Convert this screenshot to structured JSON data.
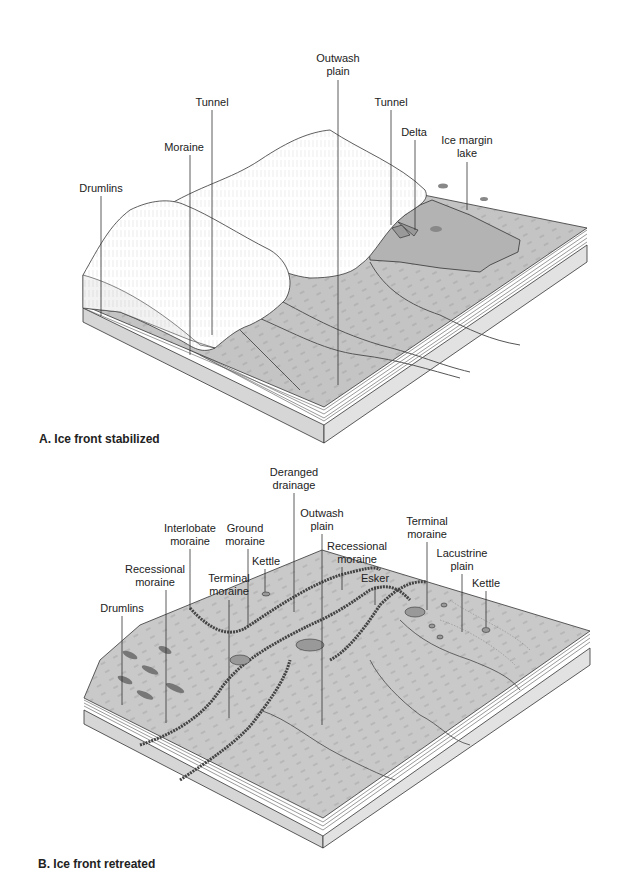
{
  "panels": [
    {
      "id": "A",
      "caption": "A. Ice front stabilized",
      "labels": [
        {
          "text": "Outwash\nplain",
          "x": 338,
          "y": 52
        },
        {
          "text": "Tunnel",
          "x": 212,
          "y": 96
        },
        {
          "text": "Tunnel",
          "x": 391,
          "y": 96
        },
        {
          "text": "Delta",
          "x": 414,
          "y": 126
        },
        {
          "text": "Ice margin\nlake",
          "x": 467,
          "y": 134
        },
        {
          "text": "Moraine",
          "x": 184,
          "y": 141
        },
        {
          "text": "Drumlins",
          "x": 101,
          "y": 182
        }
      ]
    },
    {
      "id": "B",
      "caption": "B. Ice front retreated",
      "labels": [
        {
          "text": "Deranged\ndrainage",
          "x": 294,
          "y": 466
        },
        {
          "text": "Outwash\nplain",
          "x": 322,
          "y": 507
        },
        {
          "text": "Interlobate\nmoraine",
          "x": 190,
          "y": 522
        },
        {
          "text": "Ground\nmoraine",
          "x": 245,
          "y": 522
        },
        {
          "text": "Terminal\nmoraine",
          "x": 427,
          "y": 515
        },
        {
          "text": "Recessional\nmoraine",
          "x": 357,
          "y": 540
        },
        {
          "text": "Lacustrine\nplain",
          "x": 462,
          "y": 547
        },
        {
          "text": "Recessional\nmoraine",
          "x": 155,
          "y": 563
        },
        {
          "text": "Kettle",
          "x": 266,
          "y": 555
        },
        {
          "text": "Terminal\nmoraine",
          "x": 229,
          "y": 572
        },
        {
          "text": "Esker",
          "x": 375,
          "y": 572
        },
        {
          "text": "Kettle",
          "x": 486,
          "y": 577
        },
        {
          "text": "Drumlins",
          "x": 122,
          "y": 602
        }
      ]
    }
  ],
  "colors": {
    "ice": "#ffffff",
    "ground_surface": "#c4c4c4",
    "lake": "#b3b3b3",
    "side_face": "#d9d9d9",
    "line": "#333333",
    "strata": "#555555"
  }
}
